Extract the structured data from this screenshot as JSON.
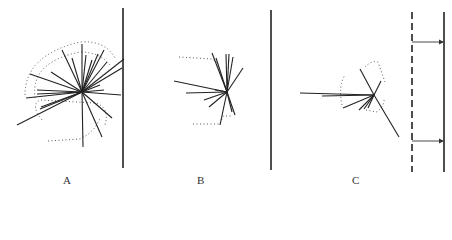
{
  "figure": {
    "panels": [
      {
        "id": "A",
        "label": "A",
        "label_pos": [
          63,
          181
        ],
        "boundary": {
          "style": "solid",
          "x": 123,
          "y1": 8,
          "y2": 168
        },
        "center": [
          82,
          92
        ],
        "rays": [
          [
            82,
            92,
            17,
            125
          ],
          [
            82,
            92,
            26,
            98
          ],
          [
            82,
            92,
            30,
            74
          ],
          [
            82,
            92,
            37,
            90
          ],
          [
            82,
            92,
            41,
            107
          ],
          [
            82,
            92,
            51,
            72
          ],
          [
            82,
            92,
            62,
            50
          ],
          [
            82,
            92,
            72,
            58
          ],
          [
            82,
            92,
            82,
            44
          ],
          [
            82,
            92,
            83,
            147
          ],
          [
            82,
            92,
            86,
            55
          ],
          [
            82,
            92,
            92,
            60
          ],
          [
            82,
            92,
            98,
            54
          ],
          [
            82,
            92,
            104,
            50
          ],
          [
            82,
            92,
            107,
            62
          ],
          [
            82,
            92,
            124,
            59
          ],
          [
            82,
            92,
            122,
            68
          ],
          [
            82,
            92,
            121,
            95
          ],
          [
            82,
            92,
            112,
            118
          ],
          [
            82,
            92,
            102,
            137
          ],
          [
            82,
            92,
            40,
            109
          ],
          [
            82,
            92,
            37,
            94
          ],
          [
            82,
            92,
            100,
            85
          ],
          [
            82,
            92,
            104,
            90
          ]
        ],
        "dotted_paths": [
          "M25 95 Q25 55 80 42 Q105 40 115 58",
          "M35 98 Q30 62 80 52 Q100 52 110 65",
          "M42 120 Q30 105 40 100 L96 103 Q110 108 105 125",
          "M48 141 L80 139 Q95 132 100 118"
        ]
      },
      {
        "id": "B",
        "label": "B",
        "label_pos": [
          197,
          181
        ],
        "boundary": {
          "style": "solid",
          "x": 271,
          "y1": 10,
          "y2": 170
        },
        "center": [
          227,
          92
        ],
        "rays": [
          [
            227,
            92,
            174,
            81
          ],
          [
            227,
            92,
            186,
            93
          ],
          [
            227,
            92,
            204,
            100
          ],
          [
            227,
            92,
            209,
            107
          ],
          [
            227,
            92,
            212,
            53
          ],
          [
            227,
            92,
            216,
            58
          ],
          [
            227,
            92,
            226,
            54
          ],
          [
            227,
            92,
            229,
            54
          ],
          [
            227,
            92,
            233,
            57
          ],
          [
            227,
            92,
            243,
            68
          ],
          [
            227,
            92,
            220,
            125
          ],
          [
            227,
            92,
            232,
            112
          ],
          [
            227,
            92,
            235,
            115
          ],
          [
            227,
            92,
            215,
            90
          ]
        ],
        "dotted_paths": [
          "M179 57 L212 59 L218 63",
          "M193 124 L220 124 L223 116 L232 116"
        ]
      },
      {
        "id": "C",
        "label": "C",
        "label_pos": [
          352,
          181
        ],
        "boundary": {
          "style": "solid",
          "x": 444,
          "y1": 12,
          "y2": 172
        },
        "dashed_boundary": {
          "x": 412,
          "y1": 12,
          "y2": 172
        },
        "arrows": [
          {
            "x1": 412,
            "y": 42,
            "x2": 443
          },
          {
            "x1": 412,
            "y": 141,
            "x2": 443
          }
        ],
        "center": [
          374,
          95
        ],
        "rays": [
          [
            374,
            95,
            300,
            93
          ],
          [
            374,
            95,
            322,
            96
          ],
          [
            374,
            95,
            343,
            108
          ],
          [
            374,
            95,
            359,
            110
          ],
          [
            374,
            95,
            364,
            109
          ],
          [
            374,
            95,
            360,
            69
          ],
          [
            374,
            95,
            399,
            137
          ],
          [
            374,
            95,
            381,
            81
          ],
          [
            374,
            95,
            368,
            108
          ]
        ],
        "dotted_paths": [
          "M342 105 Q338 86 345 75",
          "M365 67 Q372 60 378 62 L385 82",
          "M366 110 L377 112 Q385 105 384 98"
        ]
      }
    ]
  }
}
